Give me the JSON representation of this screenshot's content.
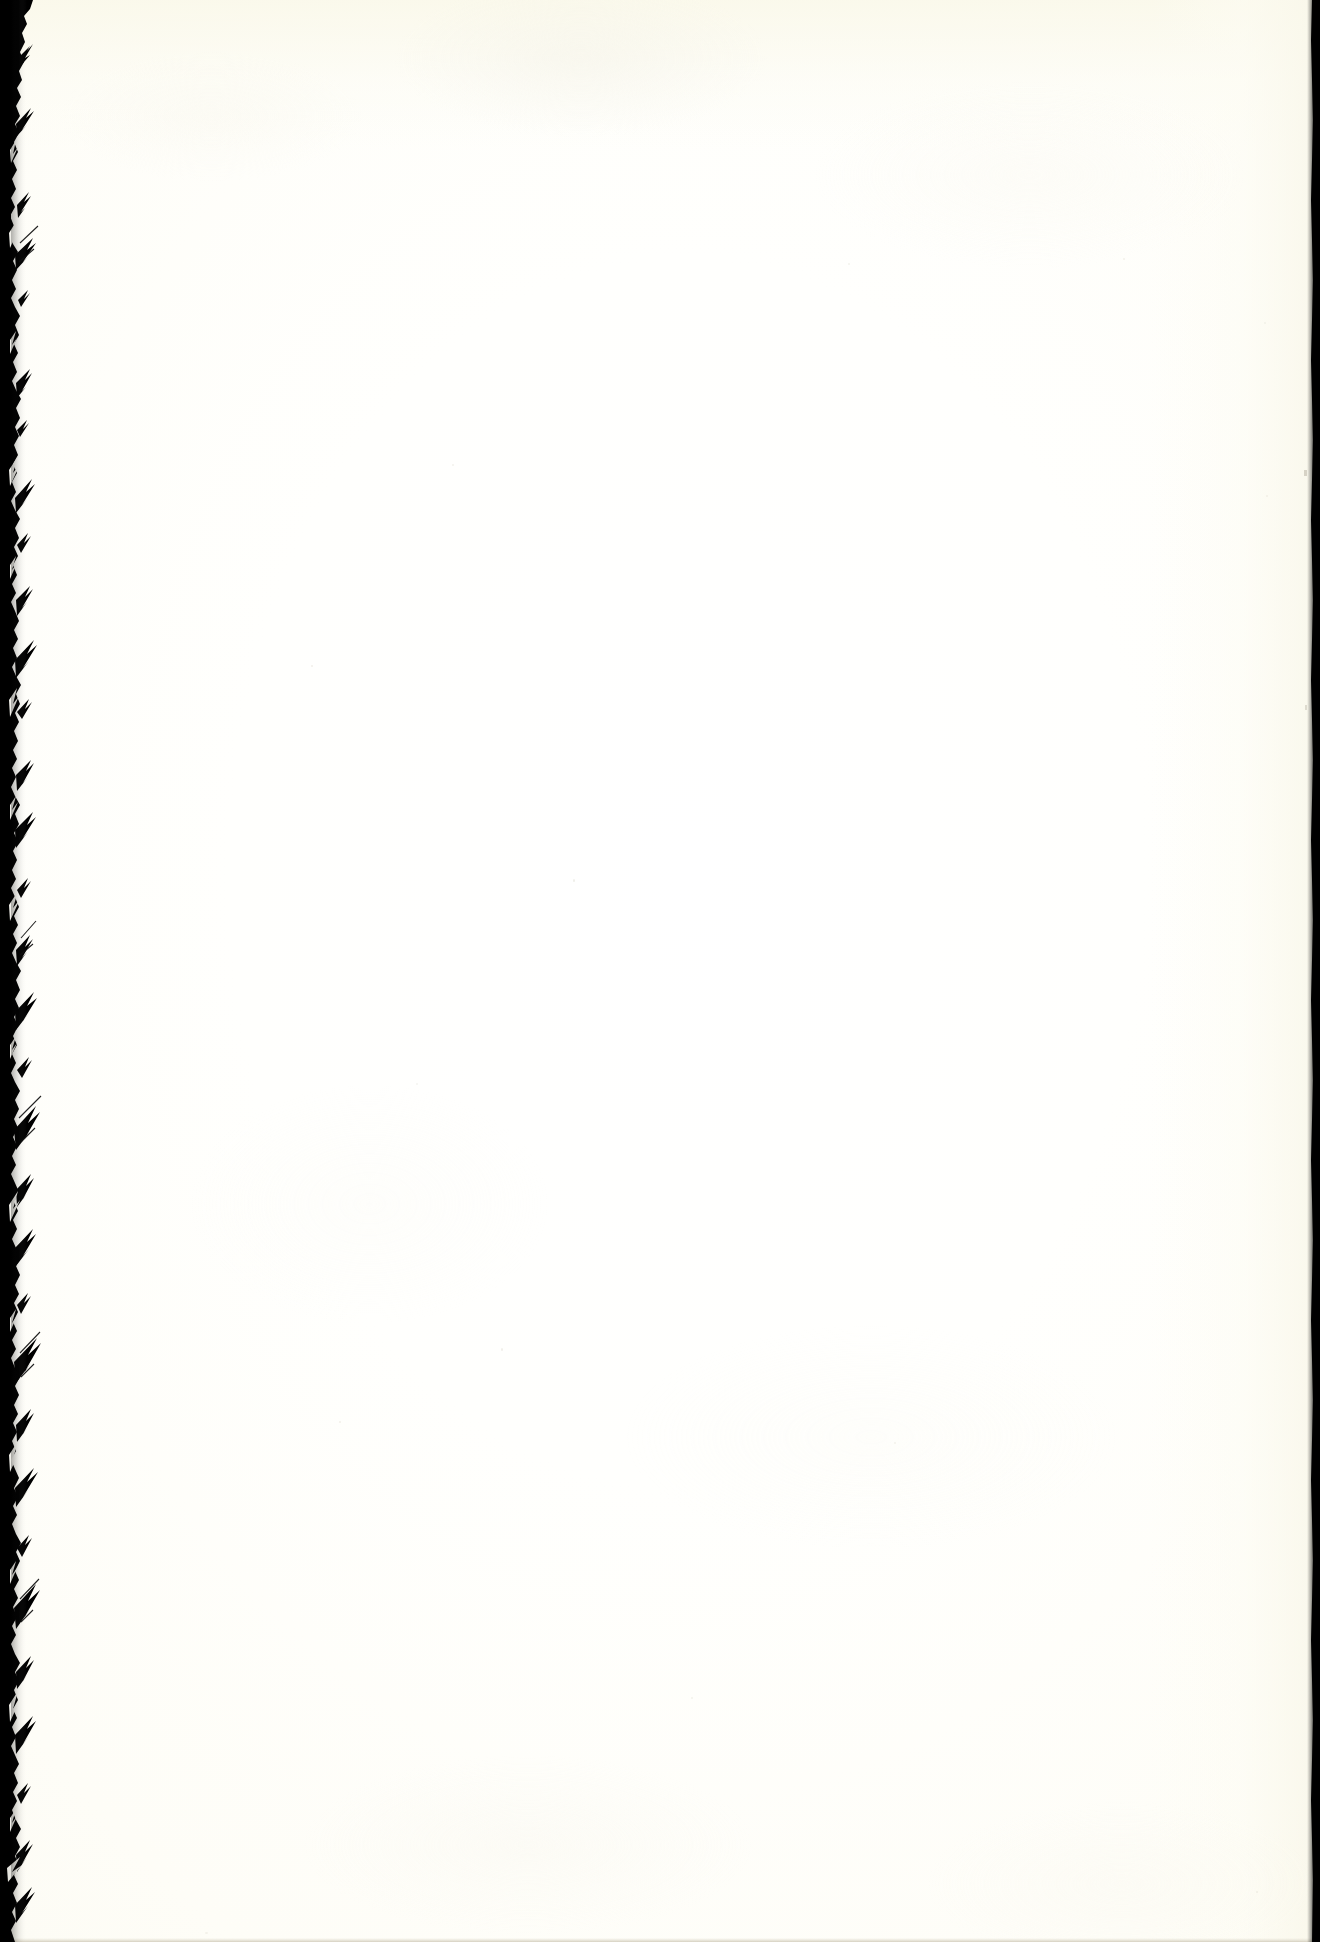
{
  "document": {
    "kind": "scanned-page",
    "page_state": "blank",
    "title": "Blank scanned page",
    "caption": "Blank page from a scanned book; no printed text or figures are present.",
    "orientation": "portrait",
    "width_px": 1320,
    "height_px": 1942
  },
  "colors": {
    "paper": "#FDFCF5",
    "paper_center": "#FFFFFF",
    "paper_warm_edge": "#F8F7ED",
    "scan_black": "#000000",
    "speck": "#CFCABC",
    "bottom_line": "#D1CCBC"
  },
  "regions": {
    "left_gutter": {
      "name": "Left scanner gutter band",
      "description": "Ragged solid-black binding gutter running the full height of the page along the left edge.",
      "approx_width_px": 22,
      "edge": "torn / irregular"
    },
    "right_edge": {
      "name": "Right page edge strip",
      "description": "Thin near-straight black strip along the right edge of the scan.",
      "approx_width_px": 7,
      "edge": "straight"
    },
    "paper_field": {
      "name": "Blank paper field",
      "description": "Cream to off-white paper surface with no printed content.",
      "text_content": ""
    }
  },
  "artifacts": {
    "dust_specks_visible": true,
    "bottom_scan_line_visible": true
  }
}
